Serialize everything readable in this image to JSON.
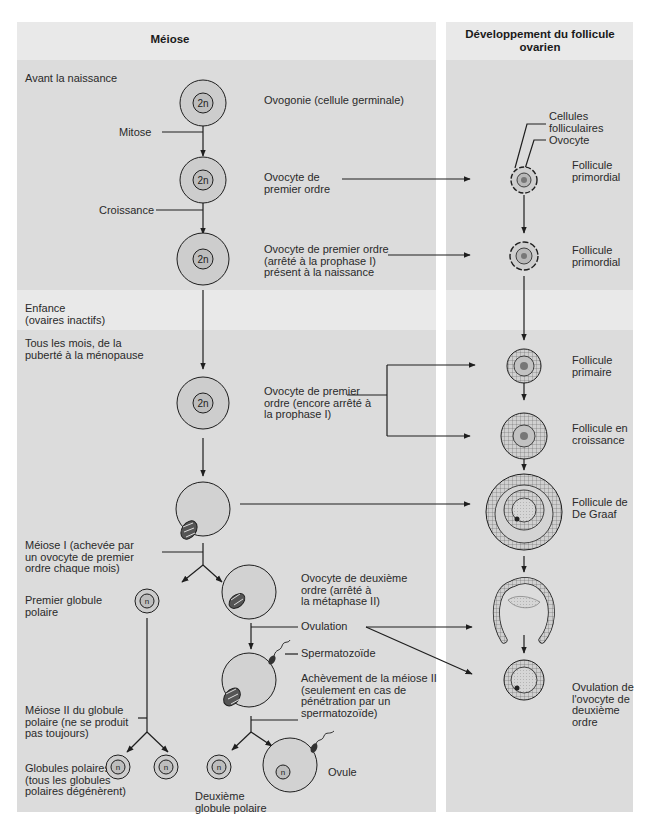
{
  "colors": {
    "page_bg": "#ffffff",
    "band_light": "#e9e9e9",
    "band_dark": "#dcdcdc",
    "cell_fill": "#c9c9c9",
    "nucleus_fill": "#bdbdbd",
    "ink": "#1e1e1e",
    "text": "#2a2a2a"
  },
  "left_panel": {
    "title": "Méiose",
    "stages": {
      "before_birth": "Avant la naissance",
      "childhood": "Enfance\n(ovaires inactifs)",
      "monthly": "Tous les mois, de la\npuberté à la ménopause"
    },
    "process_labels": {
      "mitosis": "Mitose",
      "growth": "Croissance",
      "meiosis_1": "Méiose I (achevée par\nun ovocyte de premier\nordre chaque mois)",
      "meiosis_2_polar": "Méiose II du globule\npolaire (ne se produit\npas toujours)",
      "ovulation": "Ovulation",
      "sperm": "Spermatozoïde",
      "meiosis_2_completion": "Achèvement de la méiose II\n(seulement en cas de\npénétration par un\nspermatozoïde)"
    },
    "cell_labels": {
      "oogonium": "Ovogonie (cellule germinale)",
      "primary_oocyte": "Ovocyte de\npremier ordre",
      "primary_oocyte_arrested": "Ovocyte de premier ordre\n(arrêté à la prophase I)\nprésent à la naissance",
      "primary_oocyte_still_arrested": "Ovocyte de premier\nordre (encore arrêté à\nla prophase I)",
      "first_polar_body": "Premier globule\npolaire",
      "secondary_oocyte": "Ovocyte de deuxième\nordre (arrêté à\nla métaphase II)",
      "polar_bodies": "Globules polaires\n(tous les globules\npolaires dégénèrent)",
      "second_polar_body": "Deuxième\nglobule polaire",
      "ovum": "Ovule"
    },
    "ploidy": {
      "diploid": "2n",
      "haploid": "n"
    }
  },
  "right_panel": {
    "title": "Développement du follicule\novarien",
    "annotations": {
      "follicular_cells": "Cellules\nfolliculaires",
      "oocyte": "Ovocyte"
    },
    "follicles": [
      {
        "id": "primordial_1",
        "label": "Follicule\nprimordial"
      },
      {
        "id": "primordial_2",
        "label": "Follicule\nprimordial"
      },
      {
        "id": "primary",
        "label": "Follicule\nprimaire"
      },
      {
        "id": "growing",
        "label": "Follicule en\ncroissance"
      },
      {
        "id": "graafian",
        "label": "Follicule de\nDe Graaf"
      },
      {
        "id": "ovulation",
        "label": "Ovulation de\nl'ovocyte de\ndeuxième\nordre"
      }
    ]
  }
}
